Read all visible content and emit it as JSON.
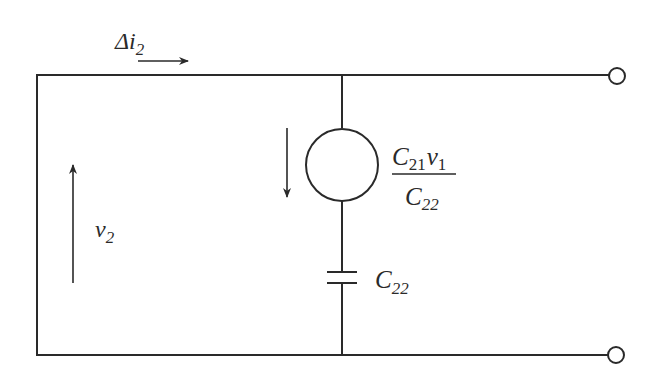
{
  "diagram": {
    "type": "circuit",
    "colors": {
      "stroke": "#2a2a2a",
      "background": "#ffffff"
    },
    "labels": {
      "current": {
        "main": "Δi",
        "sub": "2"
      },
      "voltage": {
        "main": "v",
        "sub": "2"
      },
      "source_numerator": {
        "c": "C",
        "c_sub": "21",
        "v": "v",
        "v_sub": "1"
      },
      "source_denominator": {
        "c": "C",
        "c_sub": "22"
      },
      "capacitor": {
        "main": "C",
        "sub": "22"
      }
    },
    "components": [
      {
        "id": "dependent-current-source",
        "kind": "current-source",
        "direction": "down",
        "value": "C21·v1 / C22"
      },
      {
        "id": "capacitor",
        "kind": "capacitor",
        "value": "C22"
      },
      {
        "id": "terminal-top",
        "kind": "terminal"
      },
      {
        "id": "terminal-bottom",
        "kind": "terminal"
      }
    ]
  }
}
